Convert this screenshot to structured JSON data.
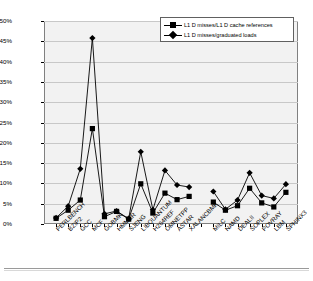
{
  "chart_data": {
    "type": "line",
    "title": "",
    "xlabel": "",
    "ylabel": "",
    "ylim": [
      0,
      50
    ],
    "ytick_labels": [
      "0%",
      "5%",
      "10%",
      "15%",
      "20%",
      "25%",
      "30%",
      "35%",
      "40%",
      "45%",
      "50%"
    ],
    "ytick_values": [
      0,
      5,
      10,
      15,
      20,
      25,
      30,
      35,
      40,
      45,
      50
    ],
    "grid": true,
    "legend_position": "top-right",
    "categories": [
      "PERLBENCH",
      "BZIP2",
      "GCC",
      "MCF",
      "GOBMK",
      "HMMER",
      "SJENG",
      "LIBQUANTUM",
      "H264REF",
      "OMNETPP",
      "ASTAR",
      "XALANCBMK",
      "",
      "MILC",
      "NAMD",
      "DEALII",
      "SOPLEX",
      "POVRAY",
      "LBM",
      "SPHINX3"
    ],
    "series": [
      {
        "name": "L1 D misses/L1 D cache references",
        "marker": "square",
        "values": [
          1.4,
          3.4,
          5.9,
          23.5,
          1.8,
          3.1,
          1.2,
          9.9,
          2.7,
          7.6,
          6.0,
          6.8,
          null,
          5.4,
          3.4,
          4.5,
          8.8,
          5.2,
          4.2,
          7.8
        ]
      },
      {
        "name": "L1 D misses/graduated loads",
        "marker": "diamond",
        "values": [
          1.5,
          4.4,
          13.6,
          45.8,
          2.5,
          3.2,
          1.3,
          17.8,
          3.5,
          13.2,
          9.6,
          9.1,
          null,
          8.0,
          3.6,
          5.9,
          12.6,
          7.0,
          6.3,
          9.8
        ]
      }
    ]
  },
  "legend": {
    "entries": [
      {
        "label": "L1 D misses/L1 D cache references",
        "marker": "square"
      },
      {
        "label": "L1 D misses/graduated loads",
        "marker": "diamond"
      }
    ]
  },
  "colors": {
    "series": "#000000",
    "plot_background": "#f2f2f2",
    "gridline": "#c8c8c8",
    "frame": "#808080",
    "page_background": "#ffffff"
  }
}
